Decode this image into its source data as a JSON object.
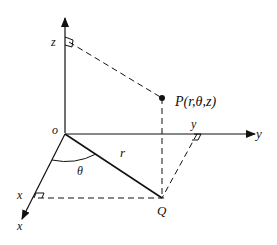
{
  "diagram": {
    "labels": {
      "z_tick": "z",
      "origin": "o",
      "point_p": "P(r,θ,z)",
      "y_tick": "y",
      "y_axis": "y",
      "r": "r",
      "theta": "θ",
      "x_tick": "x",
      "x_axis": "x",
      "q": "Q"
    },
    "colors": {
      "stroke": "#111111",
      "background": "#ffffff"
    }
  }
}
